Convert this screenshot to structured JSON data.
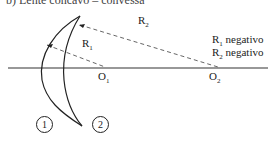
{
  "title": "b) Lente concavo – convessa",
  "labels": {
    "r1": "R",
    "r1_sub": "1",
    "r2": "R",
    "r2_sub": "2",
    "o1": "O",
    "o1_sub": "1",
    "o2": "O",
    "o2_sub": "2",
    "note1": "R",
    "note1_sub": "1",
    "note1_text": " negativo",
    "note2": "R",
    "note2_sub": "2",
    "note2_text": " negativo",
    "surface1": "1",
    "surface2": "2"
  }
}
